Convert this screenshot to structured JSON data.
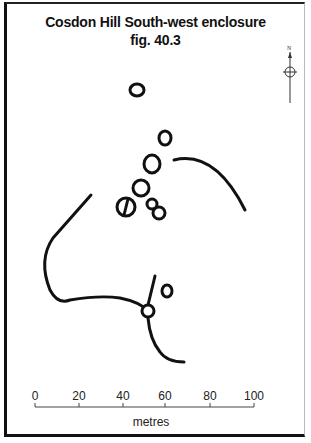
{
  "figure": {
    "title": "Cosdon Hill South-west enclosure",
    "subtitle": "fig. 40.3",
    "north_label": "N",
    "colors": {
      "ink": "#111111",
      "background": "#ffffff"
    }
  },
  "scale_bar": {
    "unit_label": "metres",
    "ticks": [
      {
        "label": "0",
        "x": 35
      },
      {
        "label": "20",
        "x": 79
      },
      {
        "label": "40",
        "x": 123
      },
      {
        "label": "60",
        "x": 165
      },
      {
        "label": "80",
        "x": 210
      },
      {
        "label": "100",
        "x": 254
      }
    ]
  },
  "features": {
    "hut_circles": [
      {
        "cx": 137,
        "cy": 90,
        "rx": 7,
        "ry": 6
      },
      {
        "cx": 165,
        "cy": 138,
        "rx": 6,
        "ry": 7
      },
      {
        "cx": 152,
        "cy": 164,
        "rx": 8,
        "ry": 9
      },
      {
        "cx": 141,
        "cy": 188,
        "rx": 8,
        "ry": 8
      },
      {
        "cx": 126,
        "cy": 207,
        "rx": 9,
        "ry": 9,
        "divided": true
      },
      {
        "cx": 152,
        "cy": 204,
        "rx": 5,
        "ry": 5
      },
      {
        "cx": 159,
        "cy": 213,
        "rx": 6,
        "ry": 6
      },
      {
        "cx": 167,
        "cy": 291,
        "rx": 5,
        "ry": 6
      },
      {
        "cx": 148,
        "cy": 311,
        "rx": 6,
        "ry": 6
      }
    ],
    "walls": [
      "M 174 160 Q 215 150 245 210",
      "M 91 195 L 53 238 Q 38 260 50 290 Q 58 305 70 300 Q 100 295 120 298 Q 140 302 148 311",
      "M 155 276 L 148 305",
      "M 148 318 Q 150 340 160 352 Q 167 362 184 362"
    ]
  }
}
